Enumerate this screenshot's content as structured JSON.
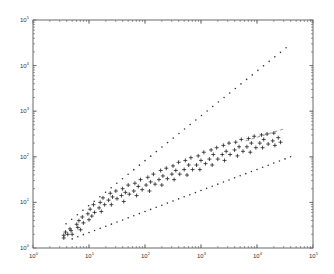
{
  "chart_data": {
    "type": "scatter",
    "title": "",
    "xlabel": "",
    "ylabel": "",
    "xscale": "log",
    "yscale": "log",
    "xlim": [
      1,
      100000
    ],
    "ylim": [
      1,
      100000
    ],
    "grid": false,
    "legend": null,
    "x_tick_labels": [
      "10^0",
      "10^1",
      "10^2",
      "10^3",
      "10^4",
      "10^5"
    ],
    "y_tick_labels": [
      "10^0",
      "10^1",
      "10^2",
      "10^3",
      "10^4",
      "10^5"
    ],
    "series": [
      {
        "name": "data",
        "marker": "+",
        "color": "#222222",
        "points_log10": [
          [
            0.55,
            0.22
          ],
          [
            0.55,
            0.28
          ],
          [
            0.58,
            0.35
          ],
          [
            0.62,
            0.3
          ],
          [
            0.66,
            0.42
          ],
          [
            0.68,
            0.38
          ],
          [
            0.7,
            0.3
          ],
          [
            0.78,
            0.52
          ],
          [
            0.8,
            0.45
          ],
          [
            0.82,
            0.6
          ],
          [
            0.85,
            0.4
          ],
          [
            0.88,
            0.68
          ],
          [
            0.9,
            0.55
          ],
          [
            0.98,
            0.75
          ],
          [
            1.0,
            0.62
          ],
          [
            1.02,
            0.85
          ],
          [
            1.05,
            0.7
          ],
          [
            1.08,
            0.95
          ],
          [
            1.1,
            0.78
          ],
          [
            1.18,
            0.88
          ],
          [
            1.2,
            1.0
          ],
          [
            1.22,
            0.8
          ],
          [
            1.25,
            1.1
          ],
          [
            1.28,
            0.95
          ],
          [
            1.35,
            1.05
          ],
          [
            1.38,
            1.2
          ],
          [
            1.4,
            0.95
          ],
          [
            1.42,
            1.12
          ],
          [
            1.48,
            1.25
          ],
          [
            1.5,
            1.08
          ],
          [
            1.58,
            1.15
          ],
          [
            1.6,
            1.3
          ],
          [
            1.62,
            1.02
          ],
          [
            1.65,
            1.22
          ],
          [
            1.7,
            1.38
          ],
          [
            1.72,
            1.18
          ],
          [
            1.8,
            1.25
          ],
          [
            1.82,
            1.42
          ],
          [
            1.85,
            1.15
          ],
          [
            1.88,
            1.35
          ],
          [
            1.92,
            1.5
          ],
          [
            1.95,
            1.28
          ],
          [
            2.02,
            1.38
          ],
          [
            2.05,
            1.55
          ],
          [
            2.08,
            1.25
          ],
          [
            2.1,
            1.45
          ],
          [
            2.15,
            1.62
          ],
          [
            2.18,
            1.4
          ],
          [
            2.25,
            1.5
          ],
          [
            2.28,
            1.7
          ],
          [
            2.3,
            1.38
          ],
          [
            2.32,
            1.58
          ],
          [
            2.38,
            1.75
          ],
          [
            2.4,
            1.52
          ],
          [
            2.48,
            1.62
          ],
          [
            2.5,
            1.8
          ],
          [
            2.52,
            1.5
          ],
          [
            2.55,
            1.7
          ],
          [
            2.6,
            1.88
          ],
          [
            2.62,
            1.62
          ],
          [
            2.7,
            1.72
          ],
          [
            2.72,
            1.92
          ],
          [
            2.75,
            1.6
          ],
          [
            2.78,
            1.82
          ],
          [
            2.82,
            1.98
          ],
          [
            2.85,
            1.72
          ],
          [
            2.92,
            1.82
          ],
          [
            2.95,
            2.02
          ],
          [
            2.98,
            1.72
          ],
          [
            3.0,
            1.92
          ],
          [
            3.05,
            2.1
          ],
          [
            3.08,
            1.85
          ],
          [
            3.15,
            1.95
          ],
          [
            3.18,
            2.15
          ],
          [
            3.2,
            1.82
          ],
          [
            3.22,
            2.05
          ],
          [
            3.28,
            2.2
          ],
          [
            3.3,
            1.95
          ],
          [
            3.38,
            2.05
          ],
          [
            3.4,
            2.25
          ],
          [
            3.42,
            1.92
          ],
          [
            3.45,
            2.12
          ],
          [
            3.5,
            2.3
          ],
          [
            3.52,
            2.05
          ],
          [
            3.6,
            2.15
          ],
          [
            3.62,
            2.32
          ],
          [
            3.65,
            2.02
          ],
          [
            3.68,
            2.22
          ],
          [
            3.72,
            2.38
          ],
          [
            3.75,
            2.12
          ],
          [
            3.82,
            2.22
          ],
          [
            3.85,
            2.4
          ],
          [
            3.88,
            2.1
          ],
          [
            3.9,
            2.3
          ],
          [
            3.95,
            2.45
          ],
          [
            3.98,
            2.2
          ],
          [
            4.05,
            2.3
          ],
          [
            4.08,
            2.48
          ],
          [
            4.1,
            2.2
          ],
          [
            4.12,
            2.38
          ],
          [
            4.18,
            2.5
          ],
          [
            4.2,
            2.28
          ],
          [
            4.28,
            2.35
          ],
          [
            4.3,
            2.52
          ],
          [
            4.32,
            2.25
          ],
          [
            4.38,
            2.42
          ],
          [
            4.42,
            2.32
          ]
        ]
      },
      {
        "name": "upper bound",
        "marker": "dot",
        "color": "#333333",
        "x_log10": [
          0.59,
          4.52
        ],
        "y_log10": [
          0.53,
          4.39
        ]
      },
      {
        "name": "lower bound",
        "marker": "dot",
        "color": "#333333",
        "x_log10": [
          0.7,
          4.6
        ],
        "y_log10": [
          0.2,
          2.0
        ]
      },
      {
        "name": "fit",
        "marker": "dash",
        "color": "#555555",
        "x_log10": [
          3.8,
          4.5
        ],
        "y_log10": [
          2.35,
          2.62
        ]
      }
    ]
  }
}
